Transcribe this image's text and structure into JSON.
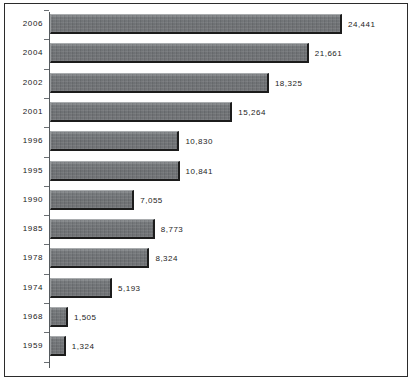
{
  "chart_data": {
    "type": "bar",
    "orientation": "horizontal",
    "title": "",
    "subtitle": "",
    "xlabel": "",
    "ylabel": "",
    "grid": false,
    "legend": null,
    "legend_position": "none",
    "xlim": [
      0,
      24441
    ],
    "categories": [
      "2006",
      "2004",
      "2002",
      "2001",
      "1996",
      "1995",
      "1990",
      "1985",
      "1978",
      "1974",
      "1968",
      "1959"
    ],
    "values": [
      24441,
      21661,
      18325,
      15264,
      10830,
      10841,
      7055,
      8773,
      8324,
      5193,
      1505,
      1324
    ],
    "value_labels": [
      "24,441",
      "21,661",
      "18,325",
      "15,264",
      "10,830",
      "10,841",
      "7,055",
      "8,773",
      "8,324",
      "5,193",
      "1,505",
      "1,324"
    ],
    "bars": [
      {
        "category": "2006",
        "value": 24441,
        "label": "24,441"
      },
      {
        "category": "2004",
        "value": 21661,
        "label": "21,661"
      },
      {
        "category": "2002",
        "value": 18325,
        "label": "18,325"
      },
      {
        "category": "2001",
        "value": 15264,
        "label": "15,264"
      },
      {
        "category": "1996",
        "value": 10830,
        "label": "10,830"
      },
      {
        "category": "1995",
        "value": 10841,
        "label": "10,841"
      },
      {
        "category": "1990",
        "value": 7055,
        "label": "7,055"
      },
      {
        "category": "1985",
        "value": 8773,
        "label": "8,773"
      },
      {
        "category": "1978",
        "value": 8324,
        "label": "8,324"
      },
      {
        "category": "1974",
        "value": 5193,
        "label": "5,193"
      },
      {
        "category": "1968",
        "value": 1505,
        "label": "1,505"
      },
      {
        "category": "1959",
        "value": 1324,
        "label": "1,324"
      }
    ],
    "colors": {
      "bar_fill": "#74777a",
      "bar_shadow": "#1c1c1c",
      "bar_highlight": "#a9acae",
      "axis": "#555a5e",
      "frame": "#2b2b2b",
      "text": "#1d1d1d",
      "background": "#ffffff"
    }
  }
}
